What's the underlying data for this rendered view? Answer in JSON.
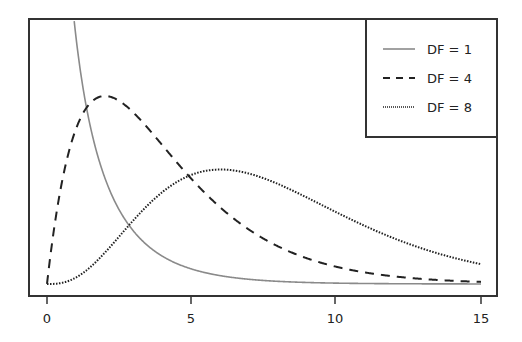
{
  "chart_data": {
    "type": "line",
    "title": "",
    "xlabel": "",
    "ylabel": "",
    "xlim": [
      0,
      15
    ],
    "ylim": [
      0,
      0.26
    ],
    "grid": false,
    "legend_position": "upper right",
    "x_ticks": [
      0,
      5,
      10,
      15
    ],
    "x_tick_labels": [
      "0",
      "5",
      "10",
      "15"
    ],
    "y_ticks": [],
    "series": [
      {
        "name": "DF = 1",
        "style": "solid",
        "color": "#8a8a8a",
        "df": 1,
        "x": [
          0.93,
          1,
          1.5,
          2,
          3,
          4,
          5,
          6,
          8,
          10,
          12,
          15
        ],
        "values": [
          0.256,
          0.242,
          0.154,
          0.104,
          0.051,
          0.027,
          0.015,
          0.008,
          0.003,
          0.001,
          0.0004,
          0.0001
        ]
      },
      {
        "name": "DF = 4",
        "style": "dashed",
        "color": "#222222",
        "df": 4,
        "x": [
          0,
          1,
          2,
          3,
          4,
          5,
          6,
          8,
          10,
          12,
          15
        ],
        "values": [
          0,
          0.152,
          0.184,
          0.167,
          0.135,
          0.103,
          0.075,
          0.037,
          0.017,
          0.007,
          0.002
        ]
      },
      {
        "name": "DF = 8",
        "style": "dotted",
        "color": "#222222",
        "df": 8,
        "x": [
          0,
          1,
          2,
          3,
          4,
          5,
          6,
          7,
          8,
          10,
          12,
          15
        ],
        "values": [
          0,
          0.006,
          0.031,
          0.063,
          0.09,
          0.107,
          0.112,
          0.107,
          0.098,
          0.07,
          0.045,
          0.02
        ]
      }
    ]
  },
  "legend": {
    "items": [
      {
        "label": "DF = 1",
        "style": "solid"
      },
      {
        "label": "DF = 4",
        "style": "dashed"
      },
      {
        "label": "DF = 8",
        "style": "dotted"
      }
    ]
  },
  "axis": {
    "x_tick_labels": [
      "0",
      "5",
      "10",
      "15"
    ]
  },
  "colors": {
    "frame": "#333333",
    "df1": "#8a8a8a",
    "df4": "#222222",
    "df8": "#222222"
  }
}
